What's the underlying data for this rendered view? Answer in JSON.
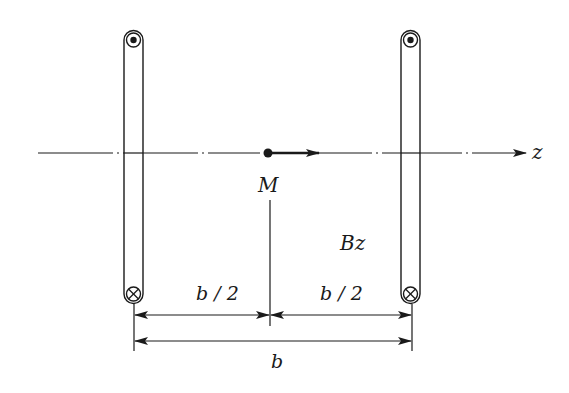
{
  "diagram": {
    "axis_label": "z",
    "point_label": "M",
    "field_label": "Bz",
    "dimensions": {
      "left_half": "b / 2",
      "right_half": "b / 2",
      "total": "b"
    },
    "coils": [
      {
        "name": "left-coil",
        "top_symbol": "current-out-of-page",
        "bottom_symbol": "current-into-page"
      },
      {
        "name": "right-coil",
        "top_symbol": "current-out-of-page",
        "bottom_symbol": "current-into-page"
      }
    ],
    "colors": {
      "stroke": "#1a1a1a",
      "background": "#ffffff"
    }
  }
}
